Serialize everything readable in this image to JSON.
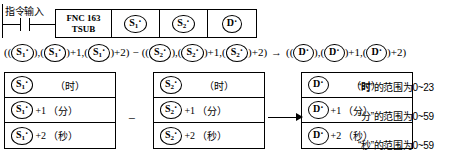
{
  "ladder": {
    "command_input_label": "指令输入",
    "contact_name": "normally-open-contact",
    "instruction": {
      "fnc_number": "FNC 163",
      "mnemonic": "TSUB",
      "operands": [
        {
          "name": "source-1",
          "letter": "S",
          "sub": "1",
          "dot": "·"
        },
        {
          "name": "source-2",
          "letter": "S",
          "sub": "2",
          "dot": "·"
        },
        {
          "name": "destination",
          "letter": "D",
          "sub": "",
          "dot": "·"
        }
      ]
    }
  },
  "formula": {
    "open1": "((",
    "s1a": {
      "letter": "S",
      "sub": "1",
      "dot": "·"
    },
    "sep1": "),(",
    "s1b": {
      "letter": "S",
      "sub": "1",
      "dot": "·"
    },
    "plus1": ")+1,(",
    "s1c": {
      "letter": "S",
      "sub": "1",
      "dot": "·"
    },
    "plus2": ")+2)",
    "minus": "−",
    "open2": "((",
    "s2a": {
      "letter": "S",
      "sub": "2",
      "dot": "·"
    },
    "sep2": "),(",
    "s2b": {
      "letter": "S",
      "sub": "2",
      "dot": "·"
    },
    "plus3": ")+1,(",
    "s2c": {
      "letter": "S",
      "sub": "2",
      "dot": "·"
    },
    "plus4": ")+2)",
    "arrow": "→",
    "open3": "((",
    "da": {
      "letter": "D",
      "sub": "",
      "dot": "·"
    },
    "sep3": "),(",
    "db": {
      "letter": "D",
      "sub": "",
      "dot": "·"
    },
    "plus5": ")+1,(",
    "dc": {
      "letter": "D",
      "sub": "",
      "dot": "·"
    },
    "plus6": ")+2)"
  },
  "tables": [
    {
      "name": "source-1-table",
      "operand": {
        "letter": "S",
        "sub": "1",
        "dot": "·"
      },
      "rows": [
        {
          "offset": "",
          "unit": "（时）"
        },
        {
          "offset": "+1",
          "unit": "（分）"
        },
        {
          "offset": "+2",
          "unit": "（秒）"
        }
      ]
    },
    {
      "name": "source-2-table",
      "operand": {
        "letter": "S",
        "sub": "2",
        "dot": "·"
      },
      "rows": [
        {
          "offset": "",
          "unit": "（时）"
        },
        {
          "offset": "+1",
          "unit": "（分）"
        },
        {
          "offset": "+2",
          "unit": "（秒）"
        }
      ]
    },
    {
      "name": "destination-table",
      "operand": {
        "letter": "D",
        "sub": "",
        "dot": "·"
      },
      "rows": [
        {
          "offset": "",
          "unit": "（时）"
        },
        {
          "offset": "+1",
          "unit": "（分）"
        },
        {
          "offset": "+2",
          "unit": "（秒）"
        }
      ]
    }
  ],
  "operators": {
    "subtract": "−",
    "result_arrow": "arrow-right-icon"
  },
  "notes": [
    "“时”的范围为0~23",
    "“分”的范围为0~59",
    "“秒”的范围为0~59"
  ],
  "colors": {
    "ink": "#000000",
    "background": "#ffffff"
  }
}
